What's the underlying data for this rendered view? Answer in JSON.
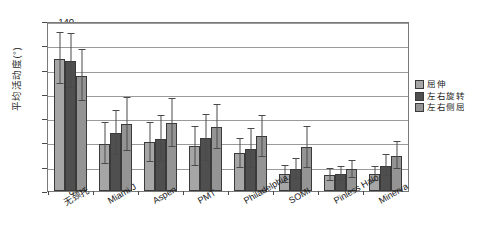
{
  "chart_data": {
    "type": "bar",
    "title": "",
    "xlabel": "",
    "ylabel": "平均活动度(°)",
    "ylim": [
      0,
      140
    ],
    "ytick_step": 20,
    "yticks": [
      0,
      20,
      40,
      60,
      80,
      100,
      120,
      140
    ],
    "grid": true,
    "legend_position": "right",
    "orientation": "vertical",
    "error_bars": "standard deviation",
    "categories": [
      "无颈托",
      "Miami J",
      "Aspen",
      "PMT",
      "Philadelphia",
      "SOMI",
      "Pinless Halo",
      "Minerva"
    ],
    "series": [
      {
        "name": "屈伸",
        "color": "#a6a6a6",
        "values": [
          109,
          39,
          40,
          37,
          31,
          14,
          13,
          14
        ],
        "errors_low": [
          21,
          17,
          16,
          16,
          12,
          7,
          5,
          6
        ],
        "errors_high": [
          21,
          17,
          16,
          16,
          12,
          7,
          5,
          6
        ]
      },
      {
        "name": "左右旋转",
        "color": "#4f4f4f",
        "values": [
          107,
          48,
          43,
          44,
          35,
          18,
          14,
          21
        ],
        "errors_low": [
          22,
          18,
          19,
          19,
          16,
          8,
          6,
          9
        ],
        "errors_high": [
          22,
          18,
          19,
          19,
          16,
          8,
          6,
          9
        ]
      },
      {
        "name": "左右侧屈",
        "color": "#949494",
        "values": [
          95,
          55,
          56,
          53,
          45,
          36,
          18,
          29
        ],
        "errors_low": [
          21,
          22,
          20,
          18,
          17,
          17,
          7,
          11
        ],
        "errors_high": [
          21,
          22,
          20,
          18,
          17,
          17,
          7,
          11
        ]
      }
    ]
  },
  "legend": {
    "items": [
      {
        "label": "屈伸"
      },
      {
        "label": "左右旋转"
      },
      {
        "label": "左右侧屈"
      }
    ]
  }
}
